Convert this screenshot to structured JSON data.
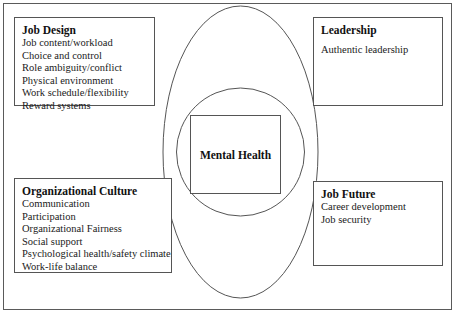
{
  "diagram": {
    "title_center": "Mental Health",
    "shapes": {
      "outer_ellipse_name": "outer-ellipse",
      "inner_circle_name": "inner-circle"
    },
    "colors": {
      "stroke": "#555555",
      "frame": "#5a5a5a",
      "background": "#ffffff",
      "text": "#111111"
    },
    "boxes": [
      {
        "id": "job-design",
        "title": "Job Design",
        "items": [
          "Job content/workload",
          "Choice and control",
          "Role ambiguity/conflict",
          "Physical environment",
          "Work schedule/flexibility",
          "Reward systems"
        ]
      },
      {
        "id": "leadership",
        "title": "Leadership",
        "items": [
          "Authentic leadership"
        ]
      },
      {
        "id": "organizational-culture",
        "title": "Organizational Culture",
        "items": [
          "Communication",
          "Participation",
          "Organizational Fairness",
          "Social support",
          "Psychological health/safety climate",
          "Work-life balance"
        ]
      },
      {
        "id": "job-future",
        "title": "Job Future",
        "items": [
          "Career development",
          "Job security"
        ]
      }
    ]
  }
}
